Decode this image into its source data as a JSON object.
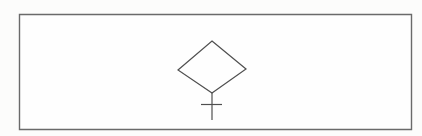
{
  "figure": {
    "background_color": "#fcfcfb",
    "frame": {
      "name": "rectangular-border-frame",
      "stroke_color": "#6a6a6a",
      "fill_color": "#fefefe",
      "d": "M 19.5 14.5 L 411.5 14.5 L 411.5 129.5 L 19.5 129.5 Z"
    },
    "shapes": {
      "stroke_color": "#4f4f4f",
      "stroke_width": 1.2,
      "diamond": {
        "name": "decision-diamond",
        "d": "M 212 41 L 246 69 L 212 93 L 178 70 Z"
      },
      "stem": {
        "name": "connector-stem",
        "d": "M 212 93 L 212 120"
      },
      "crossbar": {
        "name": "cross-tick",
        "d": "M 201 104.5 L 222 104.5"
      }
    }
  }
}
